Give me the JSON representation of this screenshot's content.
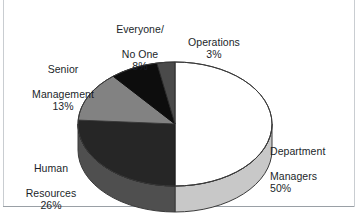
{
  "chart_data": {
    "type": "pie",
    "title": "",
    "subtitle": "",
    "xlabel": "",
    "ylabel": "",
    "legend_position": "none",
    "grid": false,
    "style": "3d-pie",
    "start_angle_deg": 0,
    "direction": "clockwise",
    "categories": [
      "Department Managers",
      "Human Resources",
      "Senior Management",
      "Everyone/ No One",
      "Operations"
    ],
    "values": [
      50,
      26,
      13,
      8,
      3
    ],
    "value_suffix": "%",
    "slices": [
      {
        "name": "Department Managers",
        "label_line1": "Department",
        "label_line2": "Managers",
        "value": 50,
        "value_text": "50%",
        "color": "#ffffff",
        "side_color": "#c8c8c8",
        "stroke": "#3a3a3a"
      },
      {
        "name": "Human Resources",
        "label_line1": "Human",
        "label_line2": "Resources",
        "value": 26,
        "value_text": "26%",
        "color": "#262626",
        "side_color": "#4f4f4f",
        "stroke": "#1a1a1a"
      },
      {
        "name": "Senior Management",
        "label_line1": "Senior",
        "label_line2": "Management",
        "value": 13,
        "value_text": "13%",
        "color": "#828282",
        "side_color": "#6d6d6d",
        "stroke": "#3a3a3a"
      },
      {
        "name": "Everyone/ No One",
        "label_line1": "Everyone/",
        "label_line2": "No One",
        "value": 8,
        "value_text": "8%",
        "color": "#0d0d0d",
        "side_color": "#2a2a2a",
        "stroke": "#0d0d0d"
      },
      {
        "name": "Operations",
        "label_line1": "Operations",
        "label_line2": "",
        "value": 3,
        "value_text": "3%",
        "color": "#4a4a4a",
        "side_color": "#3a3a3a",
        "stroke": "#2a2a2a"
      }
    ]
  },
  "labels": {
    "everyone": {
      "line1": "Everyone/",
      "line2": "No One",
      "pct": "8%"
    },
    "operations": {
      "line1": "Operations",
      "line2": "",
      "pct": "3%"
    },
    "senior": {
      "line1": "Senior",
      "line2": "Management",
      "pct": "13%"
    },
    "human": {
      "line1": "Human",
      "line2": "Resources",
      "pct": "26%"
    },
    "department": {
      "line1": "Department",
      "line2": "Managers",
      "pct": "50%"
    }
  },
  "colors": {
    "background": "#ffffff",
    "text": "#1b1f2a",
    "frame": "#9aa0a6",
    "outline": "#3a3a3a"
  },
  "geometry": {
    "cx": 175,
    "cy": 124,
    "rx": 97,
    "ry": 62,
    "depth": 26
  }
}
